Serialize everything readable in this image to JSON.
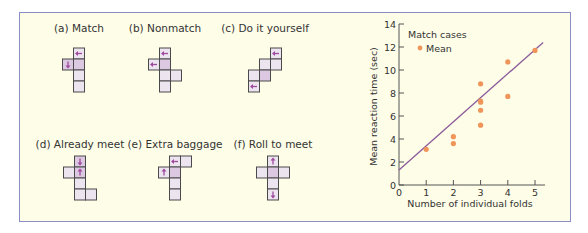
{
  "figure": {
    "panels": [
      {
        "label": "(a) Match",
        "cx": 79,
        "cells": [
          [
            1,
            0,
            0
          ],
          [
            0,
            1,
            1
          ],
          [
            1,
            1,
            1
          ],
          [
            1,
            2,
            0
          ],
          [
            1,
            3,
            0
          ]
        ],
        "arrows": [
          {
            "c": 1,
            "r": 0,
            "dir": "left"
          },
          {
            "c": 0,
            "r": 1,
            "dir": "down"
          }
        ]
      },
      {
        "label": "(b) Nonmatch",
        "cx": 165,
        "cells": [
          [
            1,
            0,
            0
          ],
          [
            0,
            1,
            0
          ],
          [
            1,
            1,
            1
          ],
          [
            2,
            2,
            0
          ],
          [
            1,
            2,
            0
          ],
          [
            1,
            3,
            0
          ]
        ],
        "arrows": [
          {
            "c": 1,
            "r": 0,
            "dir": "left"
          },
          {
            "c": 0,
            "r": 1,
            "dir": "left"
          }
        ]
      },
      {
        "label": "(c) Do it yourself",
        "cx": 265,
        "cells": [
          [
            2,
            0,
            0
          ],
          [
            1,
            1,
            0
          ],
          [
            2,
            1,
            0
          ],
          [
            0,
            2,
            0
          ],
          [
            1,
            2,
            1
          ],
          [
            0,
            3,
            0
          ]
        ],
        "arrows": [
          {
            "c": 2,
            "r": 0,
            "dir": "left"
          },
          {
            "c": 0,
            "r": 3,
            "dir": "left"
          }
        ]
      },
      {
        "label": "(d) Already meet",
        "cx": 80,
        "cells": [
          [
            1,
            0,
            1
          ],
          [
            0,
            1,
            0
          ],
          [
            1,
            1,
            1
          ],
          [
            1,
            2,
            0
          ],
          [
            1,
            3,
            0
          ],
          [
            2,
            3,
            0
          ]
        ],
        "arrows": [
          {
            "c": 1,
            "r": 0,
            "dir": "down"
          },
          {
            "c": 1,
            "r": 1,
            "dir": "up"
          }
        ]
      },
      {
        "label": "(e) Extra baggage",
        "cx": 175,
        "cells": [
          [
            1,
            0,
            0
          ],
          [
            2,
            0,
            0
          ],
          [
            0,
            1,
            0
          ],
          [
            1,
            1,
            1
          ],
          [
            1,
            2,
            0
          ],
          [
            1,
            3,
            0
          ]
        ],
        "arrows": [
          {
            "c": 1,
            "r": 0,
            "dir": "left"
          },
          {
            "c": 0,
            "r": 1,
            "dir": "up"
          }
        ]
      },
      {
        "label": "(f) Roll to meet",
        "cx": 273,
        "cells": [
          [
            1,
            0,
            0
          ],
          [
            0,
            1,
            0
          ],
          [
            1,
            1,
            1
          ],
          [
            2,
            1,
            0
          ],
          [
            1,
            2,
            0
          ],
          [
            1,
            3,
            0
          ]
        ],
        "arrows": [
          {
            "c": 1,
            "r": 0,
            "dir": "up"
          },
          {
            "c": 1,
            "r": 3,
            "dir": "down"
          }
        ]
      }
    ]
  },
  "chart_data": {
    "type": "scatter",
    "title": "",
    "legend_title": "Match cases",
    "legend": [
      "Mean"
    ],
    "xlabel": "Number of individual folds",
    "ylabel": "Mean reaction time (sec)",
    "xlim": [
      0,
      5
    ],
    "ylim": [
      0,
      14
    ],
    "xticks": [
      0,
      1,
      2,
      3,
      4,
      5
    ],
    "yticks": [
      0,
      2,
      4,
      6,
      8,
      10,
      12,
      14
    ],
    "series": [
      {
        "name": "Mean",
        "points": [
          [
            1,
            3.1
          ],
          [
            2,
            4.2
          ],
          [
            2,
            3.6
          ],
          [
            3,
            8.8
          ],
          [
            3,
            7.3
          ],
          [
            3,
            7.2
          ],
          [
            3,
            6.5
          ],
          [
            3,
            5.2
          ],
          [
            4,
            10.7
          ],
          [
            4,
            7.7
          ],
          [
            5,
            11.7
          ]
        ]
      }
    ],
    "fit_line": {
      "x0": 0,
      "y0": 1.3,
      "x1": 5.3,
      "y1": 12.4
    },
    "colors": {
      "point": "#f0955a",
      "line": "#8a5a9a",
      "axis": "#555555"
    }
  }
}
